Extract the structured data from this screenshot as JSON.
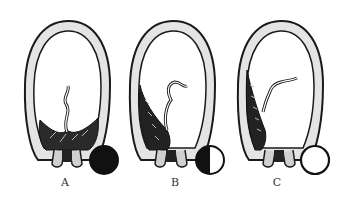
{
  "figures": [
    {
      "id": "A",
      "label": "A",
      "indicator": "full-filled-circle",
      "placenta_position": "bottom-center"
    },
    {
      "id": "B",
      "label": "B",
      "indicator": "half-filled-circle",
      "placenta_position": "lower-left"
    },
    {
      "id": "C",
      "label": "C",
      "indicator": "empty-circle",
      "placenta_position": "left-side"
    }
  ],
  "colors": {
    "ink": "#1a1a1a",
    "wall_fill": "#d9d9d9",
    "background": "#ffffff"
  }
}
